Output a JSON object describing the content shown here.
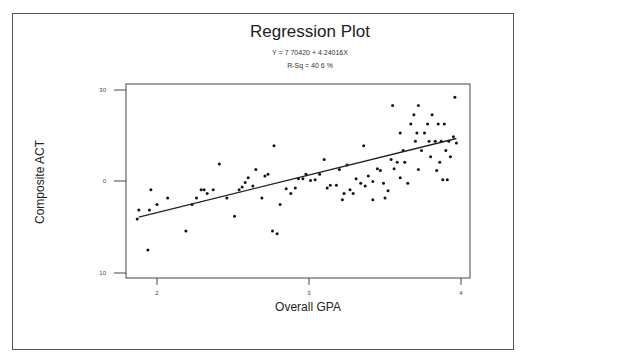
{
  "chart_data": {
    "type": "scatter",
    "title": "Regression Plot",
    "annotations": [
      "Y = 7 70420 + 4 24016X",
      "R-Sq = 40 6 %"
    ],
    "xlabel": "Overall GPA",
    "ylabel": "Composite ACT",
    "x_ticks": [
      "2",
      "3",
      "4"
    ],
    "y_ticks": [
      "30",
      "0",
      "10"
    ],
    "xlim": [
      1.8,
      4.05
    ],
    "ylim": [
      10,
      30
    ],
    "grid": false,
    "legend": null,
    "fit_line": {
      "x": [
        1.88,
        3.97
      ],
      "y": [
        16.1,
        24.7
      ]
    },
    "series": [
      {
        "name": "observations",
        "points": [
          [
            1.87,
            15.9
          ],
          [
            1.88,
            16.9
          ],
          [
            1.94,
            12.5
          ],
          [
            1.95,
            16.9
          ],
          [
            1.96,
            19.1
          ],
          [
            2.0,
            17.5
          ],
          [
            2.07,
            18.2
          ],
          [
            2.19,
            14.6
          ],
          [
            2.23,
            17.5
          ],
          [
            2.26,
            18.2
          ],
          [
            2.29,
            19.1
          ],
          [
            2.31,
            19.1
          ],
          [
            2.33,
            18.7
          ],
          [
            2.37,
            19.1
          ],
          [
            2.41,
            21.9
          ],
          [
            2.46,
            18.2
          ],
          [
            2.51,
            16.2
          ],
          [
            2.54,
            19.1
          ],
          [
            2.56,
            19.4
          ],
          [
            2.58,
            19.9
          ],
          [
            2.6,
            20.4
          ],
          [
            2.63,
            19.5
          ],
          [
            2.65,
            21.3
          ],
          [
            2.69,
            18.2
          ],
          [
            2.71,
            20.6
          ],
          [
            2.73,
            20.8
          ],
          [
            2.77,
            23.9
          ],
          [
            2.76,
            14.6
          ],
          [
            2.79,
            14.3
          ],
          [
            2.81,
            17.5
          ],
          [
            2.85,
            19.2
          ],
          [
            2.88,
            18.7
          ],
          [
            2.91,
            19.3
          ],
          [
            2.93,
            20.3
          ],
          [
            2.96,
            20.3
          ],
          [
            2.98,
            20.8
          ],
          [
            3.01,
            20.1
          ],
          [
            3.04,
            20.2
          ],
          [
            3.07,
            20.8
          ],
          [
            3.1,
            22.4
          ],
          [
            3.12,
            19.3
          ],
          [
            3.14,
            19.6
          ],
          [
            3.18,
            19.6
          ],
          [
            3.2,
            21.3
          ],
          [
            3.22,
            18.0
          ],
          [
            3.23,
            18.7
          ],
          [
            3.25,
            21.8
          ],
          [
            3.27,
            19.1
          ],
          [
            3.29,
            18.7
          ],
          [
            3.31,
            20.3
          ],
          [
            3.34,
            19.8
          ],
          [
            3.37,
            19.5
          ],
          [
            3.39,
            20.6
          ],
          [
            3.42,
            18.0
          ],
          [
            3.45,
            21.4
          ],
          [
            3.47,
            21.2
          ],
          [
            3.49,
            19.8
          ],
          [
            3.5,
            18.2
          ],
          [
            3.52,
            19.0
          ],
          [
            3.54,
            22.4
          ],
          [
            3.56,
            21.4
          ],
          [
            3.58,
            22.1
          ],
          [
            3.6,
            20.4
          ],
          [
            3.62,
            23.4
          ],
          [
            3.63,
            22.1
          ],
          [
            3.65,
            19.8
          ],
          [
            3.67,
            26.3
          ],
          [
            3.69,
            27.3
          ],
          [
            3.7,
            24.4
          ],
          [
            3.71,
            25.3
          ],
          [
            3.72,
            21.3
          ],
          [
            3.74,
            23.4
          ],
          [
            3.76,
            25.3
          ],
          [
            3.78,
            26.3
          ],
          [
            3.79,
            24.4
          ],
          [
            3.8,
            22.7
          ],
          [
            3.81,
            27.3
          ],
          [
            3.83,
            24.4
          ],
          [
            3.84,
            21.2
          ],
          [
            3.85,
            26.3
          ],
          [
            3.86,
            22.1
          ],
          [
            3.87,
            24.4
          ],
          [
            3.88,
            20.2
          ],
          [
            3.89,
            26.3
          ],
          [
            3.9,
            23.4
          ],
          [
            3.91,
            20.2
          ],
          [
            3.92,
            24.4
          ],
          [
            3.93,
            22.7
          ],
          [
            3.95,
            24.9
          ],
          [
            3.96,
            29.2
          ],
          [
            3.97,
            24.2
          ],
          [
            3.72,
            28.3
          ],
          [
            3.55,
            28.3
          ],
          [
            3.42,
            20.0
          ],
          [
            3.36,
            23.9
          ],
          [
            3.6,
            25.3
          ]
        ]
      }
    ]
  }
}
